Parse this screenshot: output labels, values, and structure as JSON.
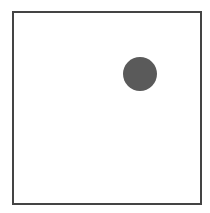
{
  "arena": {
    "border_color": "#444444",
    "background": "#ffffff"
  },
  "objects": [
    {
      "type": "circle",
      "center_x": 140,
      "center_y": 74,
      "radius": 17,
      "color": "#5a5a5a"
    }
  ]
}
